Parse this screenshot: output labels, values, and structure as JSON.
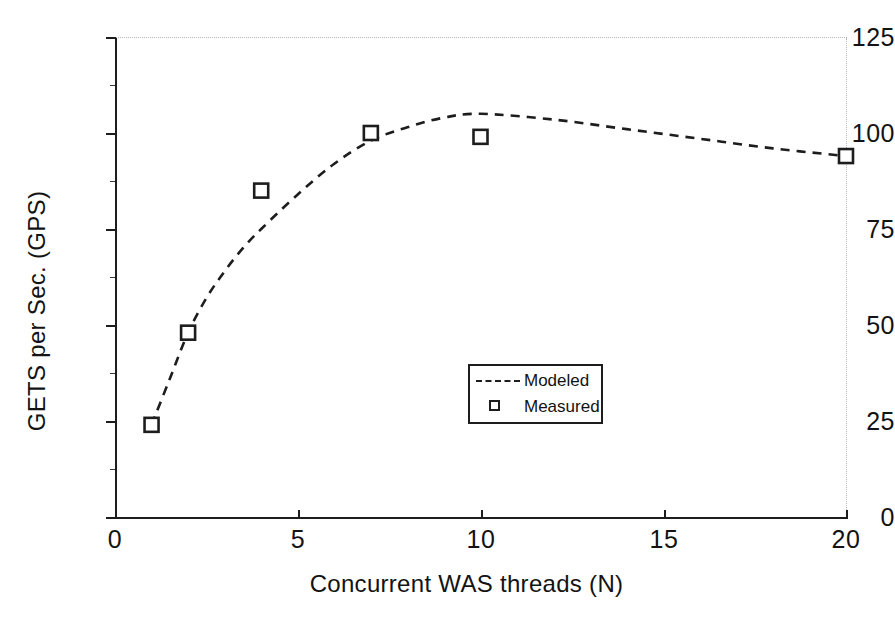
{
  "chart_data": {
    "type": "scatter",
    "title": "",
    "xlabel": "Concurrent WAS threads (N)",
    "ylabel": "GETS per Sec. (GPS)",
    "xlim": [
      0,
      20
    ],
    "ylim": [
      0,
      125
    ],
    "xticks": [
      0,
      5,
      10,
      15,
      20
    ],
    "yticks": [
      0,
      25,
      50,
      75,
      100,
      125
    ],
    "xtick_labels": [
      "0",
      "5",
      "10",
      "15",
      "20"
    ],
    "ytick_labels": [
      "0",
      "25",
      "50",
      "75",
      "100",
      "125"
    ],
    "grid": false,
    "legend_position": "center",
    "series": [
      {
        "name": "Modeled",
        "style": "dashed-line",
        "marker": "none",
        "color": "#1d1d1d",
        "x": [
          1,
          1.5,
          2,
          2.5,
          3,
          3.5,
          4,
          5,
          6,
          7,
          8,
          9,
          10,
          12,
          14,
          16,
          18,
          20
        ],
        "values": [
          24,
          36,
          48,
          57,
          64,
          70,
          75,
          84,
          92,
          98,
          101.5,
          104,
          105,
          103.5,
          101,
          98.5,
          96,
          94
        ]
      },
      {
        "name": "Measured",
        "style": "markers",
        "marker": "open-square",
        "color": "#1d1d1d",
        "x": [
          1,
          2,
          4,
          7,
          10,
          20
        ],
        "values": [
          24,
          48,
          85,
          100,
          99,
          94
        ]
      }
    ]
  },
  "legend": {
    "modeled_label": "Modeled",
    "measured_label": "Measured",
    "modeled_key": "dashed-line-icon",
    "measured_key": "open-square-icon"
  },
  "axes": {
    "y_title": "GETS per Sec. (GPS)",
    "x_title": "Concurrent WAS threads (N)"
  }
}
